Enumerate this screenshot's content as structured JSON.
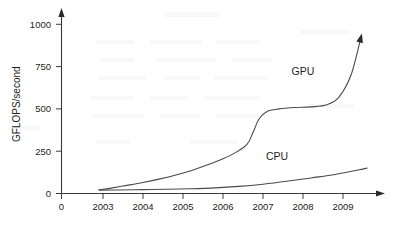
{
  "chart_data": {
    "type": "line",
    "title": "",
    "xlabel": "",
    "ylabel": "GFLOPS/second",
    "xlim": [
      2002.4,
      2009.9
    ],
    "ylim": [
      0,
      1060
    ],
    "grid": false,
    "legend_position": "inline-annotation",
    "x_tick_labels": [
      "0",
      "2003",
      "2004",
      "2005",
      "2006",
      "2007",
      "2008",
      "2009"
    ],
    "x_tick_values": [
      2002.5,
      2003,
      2004,
      2005,
      2006,
      2007,
      2008,
      2009
    ],
    "y_tick_labels": [
      "0",
      "250",
      "500",
      "750",
      "1000"
    ],
    "y_tick_values": [
      0,
      250,
      500,
      750,
      1000
    ],
    "series": [
      {
        "name": "GPU",
        "label": "GPU",
        "x": [
          2002.9,
          2003.2,
          2003.6,
          2004.0,
          2004.4,
          2004.8,
          2005.2,
          2005.6,
          2006.0,
          2006.3,
          2006.6,
          2006.75,
          2006.9,
          2007.1,
          2007.4,
          2007.8,
          2008.2,
          2008.6,
          2008.9,
          2009.2,
          2009.45
        ],
        "values": [
          22,
          32,
          48,
          65,
          85,
          108,
          135,
          168,
          205,
          240,
          290,
          360,
          440,
          485,
          500,
          508,
          512,
          525,
          570,
          700,
          925
        ]
      },
      {
        "name": "CPU",
        "label": "CPU",
        "x": [
          2002.9,
          2003.4,
          2004.0,
          2004.6,
          2005.2,
          2005.8,
          2006.4,
          2007.0,
          2007.6,
          2008.2,
          2008.8,
          2009.4,
          2009.6
        ],
        "values": [
          20,
          21,
          23,
          25,
          28,
          33,
          42,
          55,
          72,
          92,
          112,
          140,
          150
        ]
      }
    ],
    "annotations": [
      {
        "name": "gpu-label",
        "text": "GPU",
        "x": 2008.0,
        "y": 700
      },
      {
        "name": "cpu-label",
        "text": "CPU",
        "x": 2007.35,
        "y": 196
      }
    ]
  }
}
